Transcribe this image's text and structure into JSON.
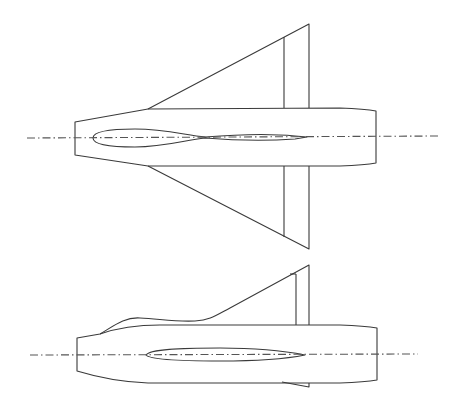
{
  "figure": {
    "description": "Technical line drawing of a delta-wing aircraft in two orthographic views",
    "views": [
      {
        "id": "plan",
        "label": "Plan view (top)"
      },
      {
        "id": "side",
        "label": "Side elevation"
      }
    ],
    "colors": {
      "background": "#ffffff",
      "line": "#3a3a3a",
      "centerline": "#555555"
    }
  }
}
